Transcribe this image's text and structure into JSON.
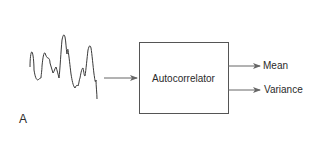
{
  "diagram": {
    "panel_label": "A",
    "input": {
      "name": "signal-waveform",
      "description": "irregular time-series signal"
    },
    "block": {
      "label": "Autocorrelator"
    },
    "outputs": [
      {
        "label": "Mean"
      },
      {
        "label": "Variance"
      }
    ],
    "colors": {
      "stroke": "#555555",
      "waveform": "#3a3a3a",
      "text": "#2a2a2a",
      "background": "#ffffff"
    }
  }
}
